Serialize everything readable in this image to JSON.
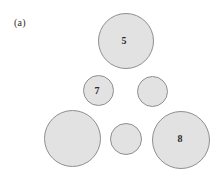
{
  "figure": {
    "panel_label": "(a)",
    "panel_label_x": 14,
    "panel_label_y": 17,
    "background_color": "#ffffff",
    "circle_fill_color": "#e2e2e2",
    "circle_stroke_color": "#8f8f8f",
    "label_color": "#2b2b2b"
  },
  "chart_data": {
    "type": "scatter",
    "title": "(a)",
    "xlabel": "",
    "ylabel": "",
    "xlim": [
      0,
      218
    ],
    "ylim": [
      0,
      179
    ],
    "grid": false,
    "legend": "none",
    "circles": [
      {
        "name": "top-circle",
        "label": "5",
        "cx": 126,
        "cy": 40.5,
        "r": 28,
        "label_x": 124,
        "label_y": 40
      },
      {
        "name": "middle-left-circle",
        "label": "7",
        "cx": 98,
        "cy": 90.5,
        "r": 15.5,
        "label_x": 97,
        "label_y": 90
      },
      {
        "name": "middle-right-circle",
        "label": "",
        "cx": 152.5,
        "cy": 91,
        "r": 15.5,
        "label_x": 152.5,
        "label_y": 91
      },
      {
        "name": "bottom-left-circle",
        "label": "",
        "cx": 72,
        "cy": 138.5,
        "r": 28.5,
        "label_x": 72,
        "label_y": 138.5
      },
      {
        "name": "bottom-middle-circle",
        "label": "",
        "cx": 126,
        "cy": 138.5,
        "r": 16,
        "label_x": 126,
        "label_y": 138.5
      },
      {
        "name": "bottom-right-circle",
        "label": "8",
        "cx": 181,
        "cy": 140,
        "r": 29,
        "label_x": 180,
        "label_y": 138
      }
    ],
    "categories": [
      "top",
      "middle-left",
      "middle-right",
      "bottom-left",
      "bottom-middle",
      "bottom-right"
    ],
    "values": [
      28,
      15.5,
      15.5,
      28.5,
      16,
      29
    ],
    "labeled_values": {
      "top": 5,
      "middle-left": 7,
      "bottom-right": 8
    }
  }
}
